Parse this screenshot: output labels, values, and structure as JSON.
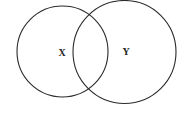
{
  "diagram": {
    "type": "venn",
    "sets": [
      {
        "id": "X",
        "label": "X",
        "cx": 62.5,
        "cy": 51.5,
        "r": 45.5
      },
      {
        "id": "Y",
        "label": "Y",
        "cx": 124.5,
        "cy": 52,
        "r": 51.5
      }
    ],
    "colors": {
      "stroke": "#2a2a2a",
      "background": "#ffffff",
      "text": "#222222"
    }
  }
}
